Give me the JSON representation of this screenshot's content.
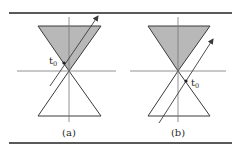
{
  "figure": {
    "panels": [
      {
        "id": "a",
        "caption": "(a)",
        "event_label": "t",
        "event_subscript": "0",
        "description": "future light cone shaded; worldline crosses past-to-future inside the future cone, event t0 inside future cone"
      },
      {
        "id": "b",
        "caption": "(b)",
        "event_label": "t",
        "event_subscript": "0",
        "description": "future light cone shaded; event t0 lies on the past cone boundary, worldline passes to the right of the apex"
      }
    ],
    "colors": {
      "shade": "#b8b8b8",
      "line": "#3a3a3a",
      "axis": "#777777",
      "rule": "#222222"
    }
  }
}
